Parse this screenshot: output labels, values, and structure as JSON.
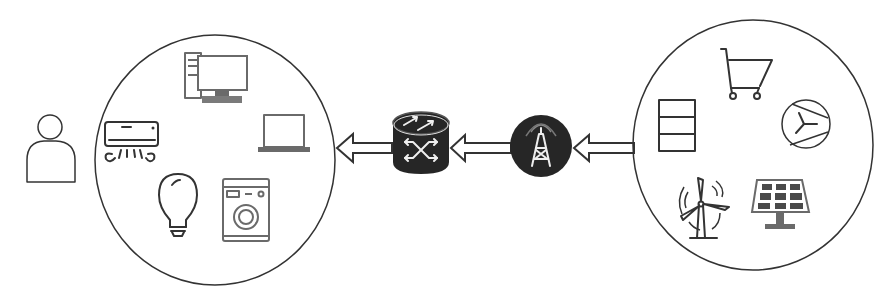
{
  "diagram": {
    "type": "energy-supply-flow",
    "flow_direction": "right-to-left",
    "colors": {
      "background": "#ffffff",
      "stroke": "#333333",
      "device_grey": "#6a6a6a",
      "hub_fill": "#262626"
    },
    "nodes": [
      {
        "id": "user",
        "icon": "person-icon"
      },
      {
        "id": "consumer-group",
        "shape": "circle",
        "icons": [
          "desktop-computer-icon",
          "air-conditioner-icon",
          "laptop-icon",
          "light-bulb-icon",
          "washing-machine-icon"
        ]
      },
      {
        "id": "router",
        "icon": "router-icon"
      },
      {
        "id": "transmission-tower",
        "icon": "radio-tower-icon"
      },
      {
        "id": "energy-sources-group",
        "shape": "circle",
        "icons": [
          "shopping-cart-icon",
          "battery-storage-icon",
          "turbine-generator-icon",
          "wind-turbine-icon",
          "solar-panel-icon"
        ]
      }
    ],
    "edges": [
      {
        "from": "energy-sources-group",
        "to": "transmission-tower",
        "style": "hollow-arrow"
      },
      {
        "from": "transmission-tower",
        "to": "router",
        "style": "hollow-arrow"
      },
      {
        "from": "router",
        "to": "consumer-group",
        "style": "hollow-arrow"
      }
    ]
  }
}
